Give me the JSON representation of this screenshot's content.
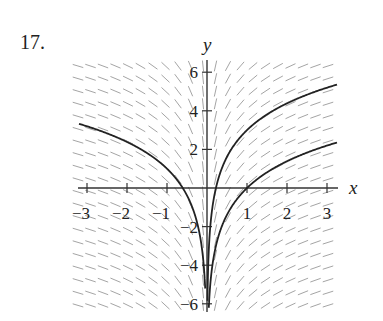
{
  "problem": {
    "number": "17."
  },
  "chart_data": {
    "type": "line",
    "subtype": "slope-field-with-solution-curves",
    "title": "",
    "xlabel": "x",
    "ylabel": "y",
    "xlim": [
      -3.2,
      3.2
    ],
    "ylim": [
      -6.3,
      6.3
    ],
    "x_ticks": [
      -3,
      -2,
      -1,
      1,
      2,
      3
    ],
    "x_tick_labels": [
      "−3",
      "−2",
      "−1",
      "1",
      "2",
      "3"
    ],
    "y_ticks": [
      6,
      4,
      2,
      -2,
      -4,
      -6
    ],
    "y_tick_labels": [
      "6",
      "4",
      "2",
      "−2",
      "−4",
      "−6"
    ],
    "grid": false,
    "legend": null,
    "slope_field": {
      "equation": "dy/dx = 2/x",
      "color": "#9a9a9a"
    },
    "series": [
      {
        "name": "left solution",
        "formula": "y = 2 ln|x| + 1",
        "domain": [
          -3,
          -0.02
        ],
        "points": [
          [
            -3,
            3.2
          ],
          [
            -2,
            2.39
          ],
          [
            -1,
            1.0
          ],
          [
            -0.6,
            -0.02
          ],
          [
            -0.3,
            -1.41
          ],
          [
            -0.1,
            -3.61
          ],
          [
            -0.05,
            -4.99
          ]
        ]
      },
      {
        "name": "upper right solution",
        "formula": "y = 2 ln x + 3",
        "domain": [
          0.02,
          3.2
        ],
        "points": [
          [
            0.05,
            -2.99
          ],
          [
            0.1,
            -1.61
          ],
          [
            0.3,
            0.59
          ],
          [
            1,
            3.0
          ],
          [
            2,
            4.39
          ],
          [
            3,
            5.2
          ]
        ]
      },
      {
        "name": "lower right solution",
        "formula": "y = 2 ln x",
        "domain": [
          0.02,
          3.2
        ],
        "points": [
          [
            0.05,
            -5.99
          ],
          [
            0.1,
            -4.61
          ],
          [
            0.5,
            -1.39
          ],
          [
            1,
            0.0
          ],
          [
            2,
            1.39
          ],
          [
            3,
            2.2
          ]
        ]
      }
    ],
    "curve_color": "#222222"
  }
}
